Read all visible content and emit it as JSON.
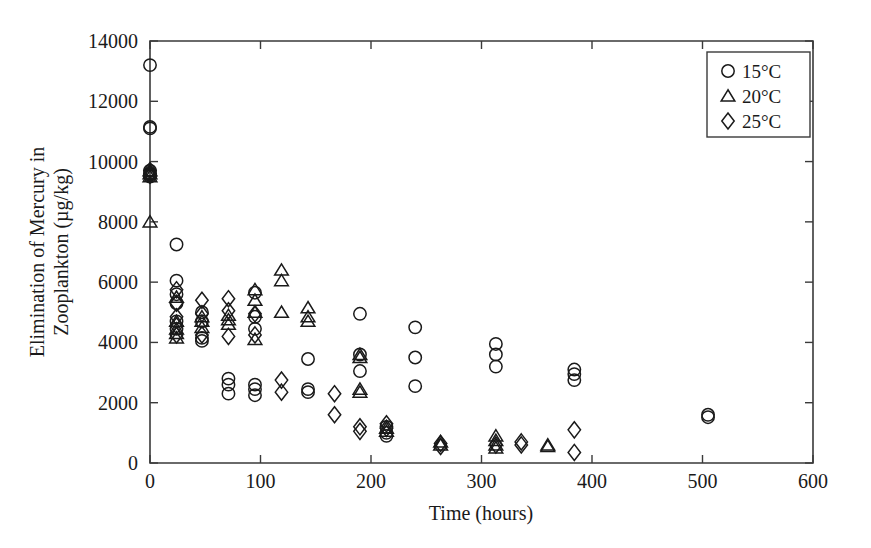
{
  "chart_data": {
    "type": "scatter",
    "title": "",
    "xlabel": "Time (hours)",
    "ylabel": "Elimination of Mercury in Zooplankton (µg/kg)",
    "ylabel_line1": "Elimination of Mercury in",
    "ylabel_line2": "Zooplankton (µg/kg)",
    "xlim": [
      0,
      600
    ],
    "ylim": [
      0,
      14000
    ],
    "xticks": [
      0,
      100,
      200,
      300,
      400,
      500,
      600
    ],
    "yticks": [
      0,
      2000,
      4000,
      6000,
      8000,
      10000,
      12000,
      14000
    ],
    "xtick_labels": [
      "0",
      "100",
      "200",
      "300",
      "400",
      "500",
      "600"
    ],
    "ytick_labels": [
      "0",
      "2000",
      "4000",
      "6000",
      "8000",
      "10000",
      "12000",
      "14000"
    ],
    "grid": false,
    "legend_position": "top-right",
    "legend": [
      {
        "label": "15°C",
        "marker": "circle"
      },
      {
        "label": "20°C",
        "marker": "triangle"
      },
      {
        "label": "25°C",
        "marker": "diamond"
      }
    ],
    "series": [
      {
        "name": "15°C",
        "marker": "circle",
        "points": [
          [
            0,
            13200
          ],
          [
            0,
            11150
          ],
          [
            0,
            11100
          ],
          [
            0,
            9700
          ],
          [
            0,
            9600
          ],
          [
            0,
            9550
          ],
          [
            0,
            9500
          ],
          [
            24,
            7250
          ],
          [
            24,
            6050
          ],
          [
            24,
            5600
          ],
          [
            24,
            5300
          ],
          [
            24,
            4700
          ],
          [
            24,
            4450
          ],
          [
            47,
            5000
          ],
          [
            47,
            4700
          ],
          [
            47,
            4150
          ],
          [
            47,
            4050
          ],
          [
            71,
            2800
          ],
          [
            71,
            2600
          ],
          [
            71,
            2300
          ],
          [
            95,
            5650
          ],
          [
            95,
            4850
          ],
          [
            95,
            4450
          ],
          [
            95,
            2600
          ],
          [
            95,
            2450
          ],
          [
            95,
            2250
          ],
          [
            143,
            3450
          ],
          [
            143,
            2450
          ],
          [
            143,
            2350
          ],
          [
            190,
            4950
          ],
          [
            190,
            3600
          ],
          [
            190,
            3050
          ],
          [
            214,
            1200
          ],
          [
            214,
            1000
          ],
          [
            214,
            900
          ],
          [
            240,
            4500
          ],
          [
            240,
            3500
          ],
          [
            240,
            2550
          ],
          [
            313,
            3950
          ],
          [
            313,
            3600
          ],
          [
            313,
            3200
          ],
          [
            384,
            3100
          ],
          [
            384,
            2950
          ],
          [
            384,
            2750
          ],
          [
            505,
            1600
          ],
          [
            505,
            1520
          ]
        ]
      },
      {
        "name": "20°C",
        "marker": "triangle",
        "points": [
          [
            0,
            9700
          ],
          [
            0,
            9600
          ],
          [
            0,
            9500
          ],
          [
            0,
            8000
          ],
          [
            24,
            5500
          ],
          [
            24,
            4700
          ],
          [
            24,
            4450
          ],
          [
            24,
            4300
          ],
          [
            24,
            4150
          ],
          [
            47,
            4850
          ],
          [
            47,
            4700
          ],
          [
            47,
            4500
          ],
          [
            71,
            4900
          ],
          [
            71,
            4750
          ],
          [
            71,
            4600
          ],
          [
            95,
            5750
          ],
          [
            95,
            5400
          ],
          [
            95,
            5000
          ],
          [
            95,
            4100
          ],
          [
            119,
            6400
          ],
          [
            119,
            6050
          ],
          [
            119,
            5000
          ],
          [
            143,
            5150
          ],
          [
            143,
            4850
          ],
          [
            143,
            4700
          ],
          [
            190,
            3600
          ],
          [
            190,
            3500
          ],
          [
            190,
            2450
          ],
          [
            190,
            2350
          ],
          [
            214,
            1150
          ],
          [
            214,
            1050
          ],
          [
            263,
            700
          ],
          [
            263,
            600
          ],
          [
            313,
            900
          ],
          [
            313,
            750
          ],
          [
            313,
            600
          ],
          [
            313,
            500
          ],
          [
            360,
            600
          ],
          [
            360,
            550
          ]
        ]
      },
      {
        "name": "25°C",
        "marker": "diamond",
        "points": [
          [
            0,
            9700
          ],
          [
            0,
            9600
          ],
          [
            0,
            9550
          ],
          [
            24,
            5750
          ],
          [
            24,
            5300
          ],
          [
            24,
            4850
          ],
          [
            24,
            4550
          ],
          [
            24,
            4250
          ],
          [
            47,
            5400
          ],
          [
            47,
            4950
          ],
          [
            47,
            4250
          ],
          [
            71,
            5450
          ],
          [
            71,
            5050
          ],
          [
            71,
            4200
          ],
          [
            95,
            4950
          ],
          [
            95,
            4250
          ],
          [
            119,
            2750
          ],
          [
            119,
            2350
          ],
          [
            167,
            2300
          ],
          [
            167,
            1600
          ],
          [
            190,
            1200
          ],
          [
            190,
            1050
          ],
          [
            214,
            1300
          ],
          [
            214,
            1150
          ],
          [
            263,
            650
          ],
          [
            263,
            550
          ],
          [
            313,
            600
          ],
          [
            336,
            700
          ],
          [
            336,
            600
          ],
          [
            384,
            1100
          ],
          [
            384,
            350
          ]
        ]
      }
    ]
  },
  "axes_geometry": {
    "plot_left": 150,
    "plot_right": 813,
    "plot_top": 41,
    "plot_bottom": 463
  }
}
